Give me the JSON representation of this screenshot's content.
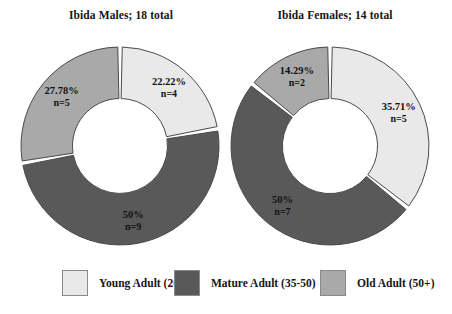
{
  "chart_data": [
    {
      "type": "pie",
      "title": "Ibida Males; 18 total",
      "total": 18,
      "categories": [
        "Young Adult (20-35)",
        "Mature Adult (35-50)",
        "Old Adult (50+)"
      ],
      "values": [
        4,
        9,
        5
      ],
      "percent_labels": [
        "22.22%",
        "50%",
        "27.78%"
      ],
      "count_labels": [
        "n=4",
        "n=9",
        "n=5"
      ],
      "legend": "bottom",
      "grid": false
    },
    {
      "type": "pie",
      "title": "Ibida Females; 14 total",
      "total": 14,
      "categories": [
        "Young Adult (20-35)",
        "Mature Adult (35-50)",
        "Old Adult (50+)"
      ],
      "values": [
        5,
        7,
        2
      ],
      "percent_labels": [
        "35.71%",
        "50%",
        "14.29%"
      ],
      "count_labels": [
        "n=5",
        "n=7",
        "n=2"
      ],
      "legend": "bottom",
      "grid": false
    }
  ],
  "charts": [
    {
      "title": "Ibida Males; 18 total",
      "slices": [
        {
          "name": "young-adult",
          "percent": "22.22%",
          "count": "n=4"
        },
        {
          "name": "mature-adult",
          "percent": "50%",
          "count": "n=9"
        },
        {
          "name": "old-adult",
          "percent": "27.78%",
          "count": "n=5"
        }
      ]
    },
    {
      "title": "Ibida Females; 14 total",
      "slices": [
        {
          "name": "young-adult",
          "percent": "35.71%",
          "count": "n=5"
        },
        {
          "name": "mature-adult",
          "percent": "50%",
          "count": "n=7"
        },
        {
          "name": "old-adult",
          "percent": "14.29%",
          "count": "n=2"
        }
      ]
    }
  ],
  "legend": {
    "items": [
      {
        "label": "Young Adult (20-35)",
        "color": "#e9e9e9"
      },
      {
        "label": "Mature Adult (35-50)",
        "color": "#595959"
      },
      {
        "label": "Old Adult (50+)",
        "color": "#a9a9a9"
      }
    ]
  },
  "colors": {
    "young_adult": "#e9e9e9",
    "mature_adult": "#595959",
    "old_adult": "#a9a9a9",
    "outline": "#4a4a4a",
    "background": "#ffffff",
    "text": "#161616"
  }
}
